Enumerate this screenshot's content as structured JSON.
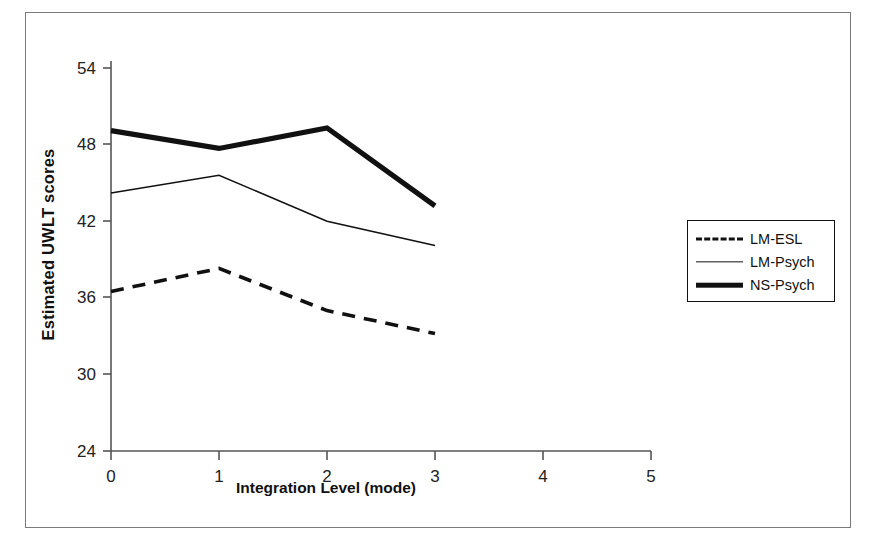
{
  "chart_data": {
    "type": "line",
    "title": "",
    "xlabel": "Integration Level (mode)",
    "ylabel": "Estimated UWLT scores",
    "x": [
      0,
      1,
      2,
      3
    ],
    "xticks": [
      "0",
      "1",
      "2",
      "3",
      "4",
      "5"
    ],
    "yticks": [
      "24",
      "30",
      "36",
      "42",
      "48",
      "54"
    ],
    "xlim": [
      0,
      5
    ],
    "ylim": [
      24,
      54
    ],
    "grid": false,
    "legend_position": "right",
    "series": [
      {
        "name": "LM-ESL",
        "style": "dashed",
        "values": [
          36.5,
          38.3,
          35.0,
          33.2
        ]
      },
      {
        "name": "LM-Psych",
        "style": "thin-solid",
        "values": [
          44.2,
          45.6,
          42.0,
          40.1
        ]
      },
      {
        "name": "NS-Psych",
        "style": "thick-solid",
        "values": [
          49.1,
          47.7,
          49.3,
          43.2
        ]
      }
    ]
  },
  "legend": {
    "items": [
      {
        "label": "LM-ESL"
      },
      {
        "label": "LM-Psych"
      },
      {
        "label": "NS-Psych"
      }
    ]
  },
  "axes": {
    "y_tick_0": "24",
    "y_tick_1": "30",
    "y_tick_2": "36",
    "y_tick_3": "42",
    "y_tick_4": "48",
    "y_tick_5": "54",
    "x_tick_0": "0",
    "x_tick_1": "1",
    "x_tick_2": "2",
    "x_tick_3": "3",
    "x_tick_4": "4",
    "x_tick_5": "5",
    "y_axis_title": "Estimated UWLT scores",
    "x_axis_title": "Integration Level (mode)"
  },
  "colors": {
    "line": "#111111",
    "axis": "#555555",
    "frame": "#7a7a7a",
    "background": "#ffffff"
  }
}
